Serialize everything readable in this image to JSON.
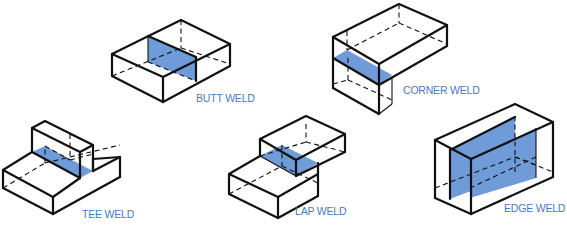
{
  "diagram": {
    "weld_color": "#6f9bd8",
    "label_color": "#4d79bd",
    "joints": [
      {
        "id": "butt",
        "label": "BUTT WELD"
      },
      {
        "id": "corner",
        "label": "CORNER WELD"
      },
      {
        "id": "tee",
        "label": "TEE WELD"
      },
      {
        "id": "lap",
        "label": "LAP WELD"
      },
      {
        "id": "edge",
        "label": "EDGE WELD"
      }
    ]
  }
}
